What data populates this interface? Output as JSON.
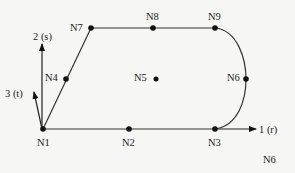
{
  "diagram": {
    "type": "finite-element-node-layout",
    "nodes": [
      {
        "id": "N1",
        "label": "N1",
        "x": 43,
        "y": 129,
        "label_x": 37,
        "label_y": 146
      },
      {
        "id": "N2",
        "label": "N2",
        "x": 129,
        "y": 129,
        "label_x": 122,
        "label_y": 146
      },
      {
        "id": "N3",
        "label": "N3",
        "x": 215,
        "y": 129,
        "label_x": 208,
        "label_y": 146
      },
      {
        "id": "N4",
        "label": "N4",
        "x": 66,
        "y": 79,
        "label_x": 46,
        "label_y": 78
      },
      {
        "id": "N5",
        "label": "N5",
        "x": 156,
        "y": 79,
        "label_x": 134,
        "label_y": 78
      },
      {
        "id": "N6",
        "label": "N6",
        "x": 246,
        "y": 79,
        "label_x": 228,
        "label_y": 78
      },
      {
        "id": "N7",
        "label": "N7",
        "x": 91,
        "y": 28,
        "label_x": 70,
        "label_y": 28
      },
      {
        "id": "N8",
        "label": "N8",
        "x": 153,
        "y": 28,
        "label_x": 146,
        "label_y": 20
      },
      {
        "id": "N9",
        "label": "N9",
        "x": 215,
        "y": 28,
        "label_x": 208,
        "label_y": 20
      }
    ],
    "edges": [
      {
        "from": "N1",
        "to": "N2",
        "shape": "line"
      },
      {
        "from": "N2",
        "to": "N3",
        "shape": "line"
      },
      {
        "from": "N1",
        "to": "N4",
        "shape": "line"
      },
      {
        "from": "N4",
        "to": "N7",
        "shape": "line"
      },
      {
        "from": "N7",
        "to": "N8",
        "shape": "line"
      },
      {
        "from": "N8",
        "to": "N9",
        "shape": "line"
      },
      {
        "from": "N9",
        "to": "N6",
        "shape": "curve"
      },
      {
        "from": "N6",
        "to": "N3",
        "shape": "curve"
      }
    ],
    "axes": [
      {
        "id": "axis-1",
        "label": "1 (r)",
        "direction": "right"
      },
      {
        "id": "axis-2",
        "label": "2 (s)",
        "direction": "up"
      },
      {
        "id": "axis-3",
        "label": "3 (t)",
        "direction": "up-left"
      }
    ],
    "extra_label": "N6",
    "colors": {
      "background": "#f6f6f4",
      "ink": "#222222"
    }
  }
}
